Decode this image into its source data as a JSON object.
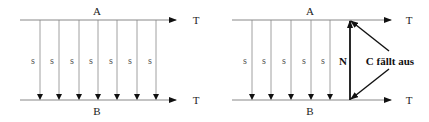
{
  "diagrams": [
    {
      "id": "left",
      "top_label": "A",
      "bottom_label": "B",
      "top_axis_label": "T",
      "bottom_axis_label": "T",
      "signal_labels": [
        "s",
        "s",
        "s",
        "s",
        "s",
        "s",
        "s"
      ]
    },
    {
      "id": "right",
      "top_label": "A",
      "bottom_label": "B",
      "top_axis_label": "T",
      "bottom_axis_label": "T",
      "signal_labels": [
        "s",
        "s",
        "s",
        "s",
        "s"
      ],
      "n_label": "N",
      "failure_label": "C fällt aus"
    }
  ],
  "colors": {
    "thin_line": "#777777",
    "thick_line": "#111111",
    "text": "#222222"
  }
}
